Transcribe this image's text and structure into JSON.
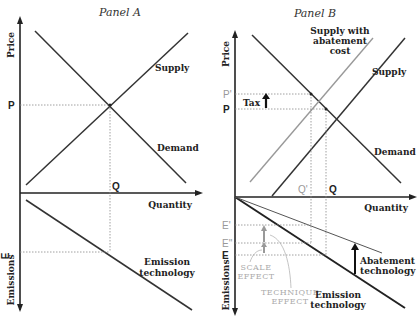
{
  "panel_a": {
    "title": "Panel A",
    "y_axis_top": "Price",
    "y_axis_bottom": "Emissions",
    "x_axis": "Quantity",
    "curves": {
      "supply": "Supply",
      "demand": "Demand",
      "emission": [
        "Emission",
        "technology"
      ]
    },
    "markers": {
      "p": "P",
      "q": "Q",
      "e": "E"
    }
  },
  "panel_b": {
    "title": "Panel B",
    "y_axis_top": "Price",
    "y_axis_bottom": "Emissions",
    "x_axis": "Quantity",
    "curves": {
      "supply_abatement": [
        "Supply with",
        "abatement",
        "cost"
      ],
      "supply": "Supply",
      "demand": "Demand",
      "abatement": [
        "Abatement",
        "technology"
      ],
      "emission": [
        "Emission",
        "technology"
      ]
    },
    "markers": {
      "p_prime": "P'",
      "p": "P",
      "q_prime": "Q'",
      "q": "Q",
      "e_prime": "E'",
      "e_double_prime": "E''",
      "e": "E"
    },
    "annotations": {
      "tax": "Tax",
      "scale_effect": [
        "SCALE",
        "EFFECT"
      ],
      "technique_effect": [
        "TECHNIQUE",
        "EFFECT"
      ]
    }
  },
  "colors": {
    "line": "#333333",
    "gray_line": "#999999",
    "dotted": "#888888"
  }
}
